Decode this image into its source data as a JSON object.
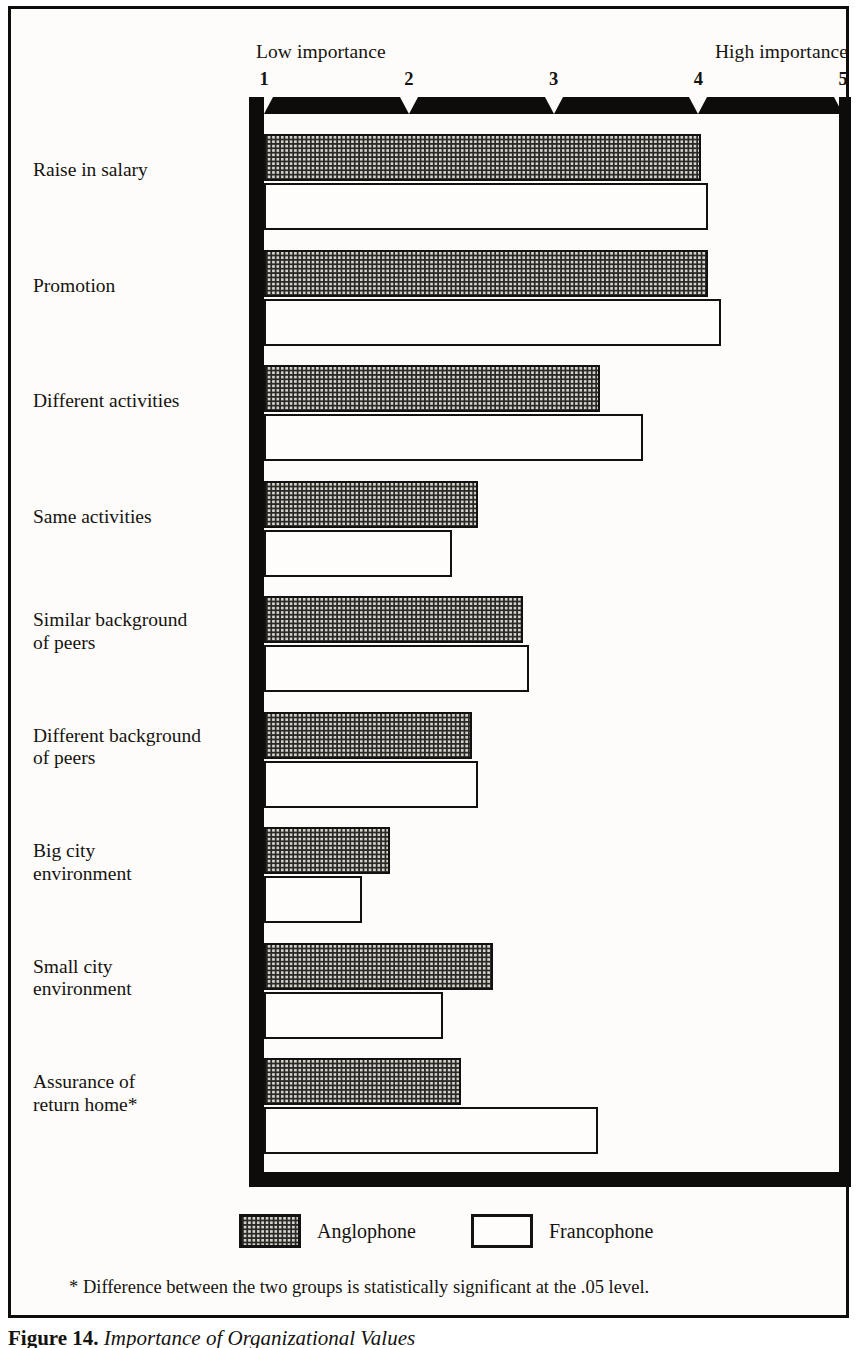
{
  "chart_data": {
    "type": "bar",
    "orientation": "horizontal",
    "title": "Importance of Organizational Values",
    "xlabel": "",
    "ylabel": "",
    "xlim": [
      1,
      5
    ],
    "xticks": [
      1,
      2,
      3,
      4,
      5
    ],
    "xtick_labels": [
      "1",
      "2",
      "3",
      "4",
      "5"
    ],
    "axis_low_label": "Low importance",
    "axis_high_label": "High importance",
    "grid": false,
    "legend_position": "bottom",
    "categories": [
      "Raise in salary",
      "Promotion",
      "Different activities",
      "Same activities",
      "Similar background\nof peers",
      "Different background\nof peers",
      "Big city\nenvironment",
      "Small city\nenvironment",
      "Assurance of\nreturn home*"
    ],
    "series": [
      {
        "name": "Anglophone",
        "values": [
          4.02,
          4.07,
          3.32,
          2.48,
          2.79,
          2.44,
          1.87,
          2.58,
          2.36
        ]
      },
      {
        "name": "Francophone",
        "values": [
          4.07,
          4.16,
          3.62,
          2.3,
          2.83,
          2.48,
          1.68,
          2.24,
          3.31
        ]
      }
    ],
    "footnote": "* Difference between the two groups is statistically significant at the .05 level.",
    "caption_label": "Figure 14.",
    "caption_text": "Importance of Organizational Values"
  },
  "legend": {
    "items": [
      {
        "label": "Anglophone",
        "swatch": "patterned-gray-swatch"
      },
      {
        "label": "Francophone",
        "swatch": "white-swatch"
      }
    ]
  },
  "colors": {
    "ink": "#0d0c0a",
    "anglophone_fill": "#d6d3cd",
    "anglophone_dots": "#2b2926",
    "francophone_fill": "#fefdfb",
    "page": "#fdfcfa"
  }
}
